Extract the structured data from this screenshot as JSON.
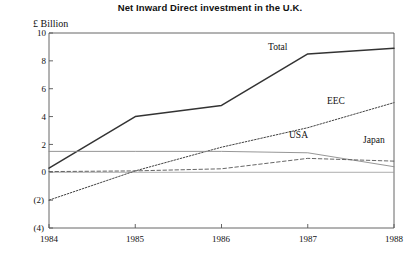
{
  "chart_data": {
    "type": "line",
    "title": "Net Inward Direct investment in the U.K.",
    "ylabel": "£ Billion",
    "xlabel": "",
    "x": [
      1984,
      1985,
      1986,
      1987,
      1988
    ],
    "xtick_labels": [
      "1984",
      "1985",
      "1986",
      "1987",
      "1988"
    ],
    "ytick_labels": [
      "10",
      "8",
      "6",
      "4",
      "2",
      "0",
      "(2)",
      "(4)"
    ],
    "ytick_values": [
      10,
      8,
      6,
      4,
      2,
      0,
      -2,
      -4
    ],
    "ylim": [
      -4,
      10
    ],
    "xlim": [
      1984,
      1988
    ],
    "grid": false,
    "legend": "inline-labels",
    "series": [
      {
        "name": "Total",
        "values": [
          0.3,
          4.0,
          4.8,
          8.5,
          8.9
        ],
        "style": "solid",
        "color": "#333333",
        "label_x": 1986.55,
        "label_y": 9.0
      },
      {
        "name": "EEC",
        "values": [
          -2.0,
          0.1,
          1.8,
          3.2,
          5.0
        ],
        "style": "dotted",
        "color": "#444444",
        "label_x": 1987.05,
        "label_y": 6.3
      },
      {
        "name": "USA",
        "values": [
          1.5,
          1.5,
          1.5,
          1.4,
          0.4
        ],
        "style": "solid-thin",
        "color": "#8a8a8a",
        "label_x": 1986.55,
        "label_y": 2.6
      },
      {
        "name": "Japan",
        "values": [
          0.05,
          0.1,
          0.25,
          1.0,
          0.8
        ],
        "style": "dashed",
        "color": "#555555",
        "label_x": 1987.55,
        "label_y": 2.2
      }
    ],
    "zero_baseline": 0,
    "annotations": []
  }
}
